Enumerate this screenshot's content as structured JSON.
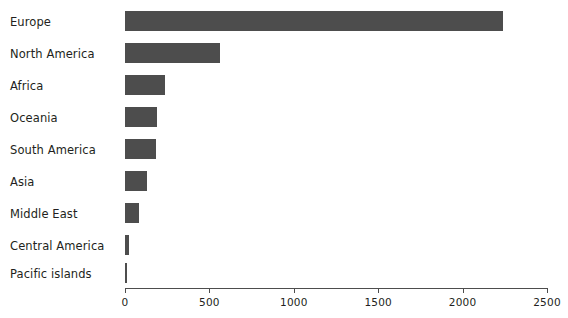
{
  "chart_data": {
    "type": "bar",
    "orientation": "horizontal",
    "title": "",
    "xlabel": "",
    "ylabel": "",
    "grid": false,
    "legend": false,
    "xlim": [
      0,
      2500
    ],
    "xticks": [
      0,
      500,
      1000,
      1500,
      2000,
      2500
    ],
    "xtick_labels": [
      "0",
      "500",
      "1000",
      "1500",
      "2000",
      "2500"
    ],
    "categories": [
      "Europe",
      "North America",
      "Africa",
      "Oceania",
      "South America",
      "Asia",
      "Middle East",
      "Central America",
      "Pacific islands"
    ],
    "values": [
      2240,
      560,
      235,
      190,
      185,
      130,
      80,
      25,
      12
    ],
    "bar_color": "#4d4d4d",
    "text_color": "#231f20",
    "axis_color": "#4d4d4d",
    "background_color": "#ffffff"
  }
}
